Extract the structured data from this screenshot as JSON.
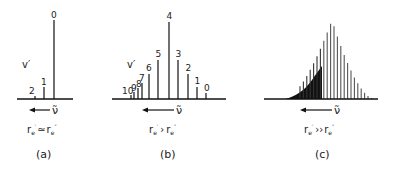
{
  "figure": {
    "axis_symbol": "ν̃",
    "vib_label": "v′",
    "panels": [
      {
        "id": "a",
        "caption": "(a)",
        "condition": {
          "left": "r",
          "left_sub": "e",
          "left_prime": "′",
          "rel": "≃",
          "right": "r",
          "right_sub": "e",
          "right_prime": "″"
        },
        "peaks": [
          {
            "v": "0",
            "x": 54,
            "h": 79
          },
          {
            "v": "1",
            "x": 44,
            "h": 12
          },
          {
            "v": "2",
            "x": 35,
            "h": 3
          }
        ]
      },
      {
        "id": "b",
        "caption": "(b)",
        "condition": {
          "left": "r",
          "left_sub": "e",
          "left_prime": "′",
          "rel": "›",
          "right": "r",
          "right_sub": "e",
          "right_prime": "″"
        },
        "peaks": [
          {
            "v": "0",
            "x": 206,
            "h": 6
          },
          {
            "v": "1",
            "x": 197,
            "h": 12
          },
          {
            "v": "2",
            "x": 188,
            "h": 25
          },
          {
            "v": "3",
            "x": 178,
            "h": 39
          },
          {
            "v": "4",
            "x": 169,
            "h": 77
          },
          {
            "v": "5",
            "x": 158,
            "h": 39
          },
          {
            "v": "6",
            "x": 149,
            "h": 25
          },
          {
            "v": "7",
            "x": 142,
            "h": 16
          },
          {
            "v": "8",
            "x": 138,
            "h": 11
          },
          {
            "v": "9",
            "x": 134,
            "h": 7
          },
          {
            "v": "10",
            "x": 131,
            "h": 4
          }
        ]
      },
      {
        "id": "c",
        "caption": "(c)",
        "condition": {
          "left": "r",
          "left_sub": "e",
          "left_prime": "′",
          "rel": "››",
          "right": "r",
          "right_sub": "e",
          "right_prime": "″"
        }
      }
    ]
  }
}
